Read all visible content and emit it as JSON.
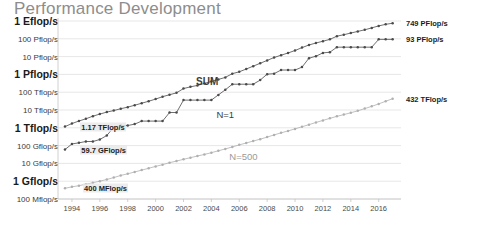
{
  "chart_data": {
    "type": "line",
    "title": "Performance Development",
    "xlabel": "",
    "ylabel": "",
    "grid": true,
    "legend_position": "inline-annotations",
    "yscale": "log",
    "ylim": [
      100000000,
      1000000000000000000
    ],
    "ytick_labels": [
      "1 Eflop/s",
      "100 Pflop/s",
      "10 Pflop/s",
      "1 Pflop/s",
      "100 Tflop/s",
      "10 Tflop/s",
      "1 Tflop/s",
      "100 Gflop/s",
      "10 Gflop/s",
      "1 Gflop/s",
      "100 Mflop/s"
    ],
    "ytick_values": [
      1000000000000000000,
      100000000000000000,
      10000000000000000,
      1000000000000000,
      100000000000000,
      10000000000000,
      1000000000000,
      100000000000,
      10000000000,
      1000000000,
      100000000
    ],
    "ytick_major": [
      true,
      false,
      false,
      true,
      false,
      false,
      true,
      false,
      false,
      true,
      false
    ],
    "xtick_labels": [
      "1994",
      "1996",
      "1998",
      "2000",
      "2002",
      "2004",
      "2006",
      "2008",
      "2010",
      "2012",
      "2014",
      "2016"
    ],
    "xlim": [
      1993.0,
      2017.6
    ],
    "categories": [
      1993.5,
      1994.0,
      1994.5,
      1995.0,
      1995.5,
      1996.0,
      1996.5,
      1997.0,
      1997.5,
      1998.0,
      1998.5,
      1999.0,
      1999.5,
      2000.0,
      2000.5,
      2001.0,
      2001.5,
      2002.0,
      2002.5,
      2003.0,
      2003.5,
      2004.0,
      2004.5,
      2005.0,
      2005.5,
      2006.0,
      2006.5,
      2007.0,
      2007.5,
      2008.0,
      2008.5,
      2009.0,
      2009.5,
      2010.0,
      2010.5,
      2011.0,
      2011.5,
      2012.0,
      2012.5,
      2013.0,
      2013.5,
      2014.0,
      2014.5,
      2015.0,
      2015.5,
      2016.0,
      2016.5,
      2017.0
    ],
    "series": [
      {
        "name": "SUM",
        "color": "#4a4a4a",
        "values": [
          1170000000000.0,
          1730000000000.0,
          2400000000000.0,
          3200000000000.0,
          4500000000000.0,
          5900000000000.0,
          7600000000000.0,
          9300000000000.0,
          11800000000000.0,
          14500000000000.0,
          18500000000000.0,
          24000000000000.0,
          31000000000000.0,
          41000000000000.0,
          56000000000000.0,
          72000000000000.0,
          92000000000000.0,
          160000000000000.0,
          200000000000000.0,
          240000000000000.0,
          310000000000000.0,
          400000000000000.0,
          520000000000000.0,
          680000000000000.0,
          1100000000000000.0,
          1400000000000000.0,
          2000000000000000.0,
          2900000000000000.0,
          4200000000000000.0,
          6100000000000000.0,
          8900000000000000.0,
          1.2e+16,
          1.6e+16,
          2.2e+16,
          3.2e+16,
          4.5e+16,
          5.8e+16,
          7.3e+16,
          9.3e+16,
          1.4e+17,
          1.7e+17,
          2.1e+17,
          2.6e+17,
          3.2e+17,
          4.1e+17,
          5.3e+17,
          6.5e+17,
          7.49e+17
        ]
      },
      {
        "name": "N=1",
        "color": "#4a4a4a",
        "values": [
          59700000000.0,
          124000000000.0,
          143000000000.0,
          170000000000.0,
          170000000000.0,
          220000000000.0,
          370000000000.0,
          1070000000000.0,
          1340000000000.0,
          1340000000000.0,
          1610000000000.0,
          2380000000000.0,
          2380000000000.0,
          2380000000000.0,
          2380000000000.0,
          7230000000000.0,
          7230000000000.0,
          35900000000000.0,
          35900000000000.0,
          35900000000000.0,
          35900000000000.0,
          35900000000000.0,
          70700000000000.0,
          136000000000000.0,
          281000000000000.0,
          281000000000000.0,
          281000000000000.0,
          281000000000000.0,
          478000000000000.0,
          1030000000000000.0,
          1105000000000000.0,
          1759000000000000.0,
          1759000000000000.0,
          1759000000000000.0,
          2566000000000000.0,
          8162000000000000.0,
          1.051e+16,
          1.617e+16,
          1.759e+16,
          3.386e+16,
          3.386e+16,
          3.386e+16,
          3.386e+16,
          3.386e+16,
          3.386e+16,
          9.3e+16,
          9.3e+16,
          9.3e+16
        ]
      },
      {
        "name": "N=500",
        "color": "#b0b0b0",
        "values": [
          400000000.0,
          480000000.0,
          560000000.0,
          680000000.0,
          820000000.0,
          1000000000.0,
          1250000000.0,
          1600000000.0,
          2100000000.0,
          2600000000.0,
          3300000000.0,
          4200000000.0,
          5300000000.0,
          6800000000.0,
          8500000000.0,
          11000000000.0,
          13500000000.0,
          17000000000.0,
          21000000000.0,
          26000000000.0,
          32000000000.0,
          40000000000.0,
          51000000000.0,
          65000000000.0,
          84000000000.0,
          110000000000.0,
          140000000000.0,
          180000000000.0,
          230000000000.0,
          300000000000.0,
          400000000000.0,
          520000000000.0,
          670000000000.0,
          870000000000.0,
          1150000000000.0,
          1500000000000.0,
          2000000000000.0,
          2600000000000.0,
          3400000000000.0,
          4400000000000.0,
          5500000000000.0,
          7000000000000.0,
          9000000000000.0,
          12000000000000.0,
          16000000000000.0,
          22000000000000.0,
          31000000000000.0,
          43200000000000.0
        ]
      }
    ],
    "annotations": [
      {
        "id": "sum-start",
        "text": "1.17 TFlop/s",
        "x": 1994.6,
        "value": 1170000000000.0
      },
      {
        "id": "n1-start",
        "text": "59.7 GFlop/s",
        "x": 1994.6,
        "value": 59700000000.0
      },
      {
        "id": "n500-start",
        "text": "400 MFlop/s",
        "x": 1994.8,
        "value": 400000000.0
      },
      {
        "id": "sum-end",
        "text": "749 PFlop/s",
        "x": 2017.0,
        "value": 7.49e+17
      },
      {
        "id": "n1-end",
        "text": "93 PFlop/s",
        "x": 2017.0,
        "value": 9.3e+16
      },
      {
        "id": "n500-end",
        "text": "432 TFlop/s",
        "x": 2017.0,
        "value": 43200000000000.0
      }
    ],
    "series_labels": [
      {
        "id": "sum",
        "text": "SUM",
        "x": 2003.7,
        "value": 400000000000000.0
      },
      {
        "id": "n1",
        "text": "N=1",
        "x": 2005.0,
        "value": 6000000000000.0
      },
      {
        "id": "n500",
        "text": "N=500",
        "x": 2006.3,
        "value": 26000000000.0
      }
    ]
  }
}
